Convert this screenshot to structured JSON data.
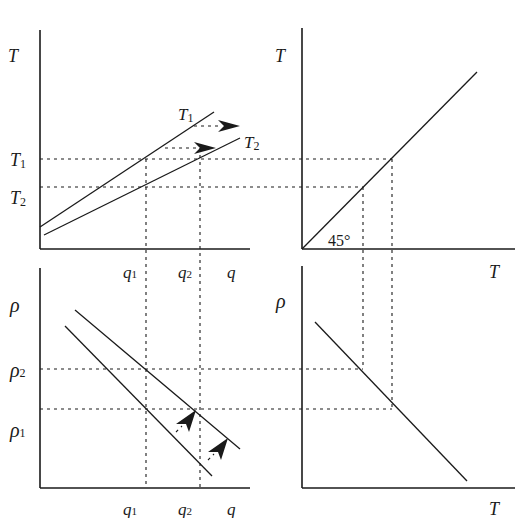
{
  "figure": {
    "panels": {
      "top_left": {
        "y_axis_label": "T",
        "y_ticks": [
          "T1",
          "T2"
        ],
        "x_ticks": [
          "q1",
          "q2",
          "q"
        ],
        "curve_labels": [
          "T1",
          "T2"
        ]
      },
      "top_right": {
        "y_axis_label": "T",
        "x_axis_label": "T",
        "angle_label": "45°"
      },
      "bottom_left": {
        "y_axis_label": "ρ",
        "y_ticks": [
          "ρ2",
          "ρ1"
        ],
        "x_ticks": [
          "q1",
          "q2",
          "q"
        ]
      },
      "bottom_right": {
        "y_axis_label": "ρ",
        "x_axis_label": "T"
      }
    }
  },
  "labels": {
    "tl_T": "T",
    "tl_T1_tick": "T",
    "tl_T1_sub": "1",
    "tl_T2_tick": "T",
    "tl_T2_sub": "2",
    "tl_curve_T1": "T",
    "tl_curve_T1_sub": "1",
    "tl_curve_T2": "T",
    "tl_curve_T2_sub": "2",
    "mid_q1": "q",
    "mid_q1_sub": "1",
    "mid_q2": "q",
    "mid_q2_sub": "2",
    "mid_q": "q",
    "tr_T": "T",
    "tr_xT": "T",
    "tr_angle": "45°",
    "bl_rho": "ρ",
    "bl_rho2": "ρ",
    "bl_rho2_sub": "2",
    "bl_rho1": "ρ",
    "bl_rho1_sub": "1",
    "bot_q1": "q",
    "bot_q1_sub": "1",
    "bot_q2": "q",
    "bot_q2_sub": "2",
    "bot_q": "q",
    "br_rho": "ρ",
    "br_xT": "T"
  }
}
